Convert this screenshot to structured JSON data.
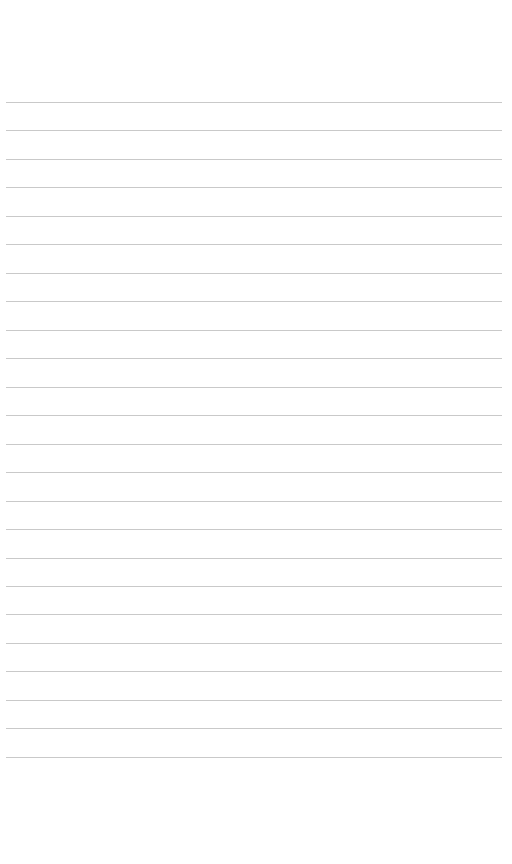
{
  "page": {
    "type": "lined-paper",
    "background_color": "#ffffff",
    "line_color": "#c9c9c9",
    "line_count": 24,
    "first_line_y": 102,
    "line_spacing": 28.47,
    "line_left": 6,
    "line_right": 502,
    "lines": [
      "",
      "",
      "",
      "",
      "",
      "",
      "",
      "",
      "",
      "",
      "",
      "",
      "",
      "",
      "",
      "",
      "",
      "",
      "",
      "",
      "",
      "",
      "",
      ""
    ]
  }
}
